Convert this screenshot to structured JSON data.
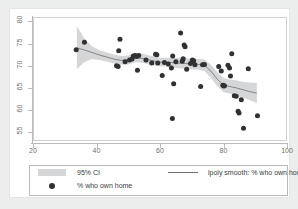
{
  "chart_data": {
    "type": "scatter",
    "title": "",
    "xlabel": "",
    "ylabel": "",
    "xlim": [
      20,
      100
    ],
    "ylim": [
      53,
      81
    ],
    "xticks": [
      20,
      40,
      60,
      80,
      100
    ],
    "yticks": [
      55,
      60,
      65,
      70,
      75,
      80
    ],
    "grid": false,
    "legend_position": "bottom",
    "series": [
      {
        "name": "% who own home",
        "type": "scatter",
        "marker": "filled-circle",
        "color": "#2f3133",
        "points": [
          [
            33.6,
            73.6
          ],
          [
            36.2,
            75.3
          ],
          [
            46.3,
            70.0
          ],
          [
            46.8,
            69.8
          ],
          [
            47.0,
            73.4
          ],
          [
            47.4,
            76.0
          ],
          [
            49.0,
            70.9
          ],
          [
            50.4,
            71.3
          ],
          [
            51.2,
            71.5
          ],
          [
            51.6,
            72.2
          ],
          [
            52.2,
            72.3
          ],
          [
            52.6,
            72.1
          ],
          [
            52.9,
            69.0
          ],
          [
            53.3,
            72.3
          ],
          [
            55.6,
            71.3
          ],
          [
            57.4,
            70.6
          ],
          [
            58.6,
            72.6
          ],
          [
            59.0,
            72.5
          ],
          [
            59.3,
            70.6
          ],
          [
            60.7,
            67.8
          ],
          [
            61.4,
            70.7
          ],
          [
            62.6,
            70.4
          ],
          [
            63.6,
            69.5
          ],
          [
            63.9,
            58.1
          ],
          [
            64.0,
            72.2
          ],
          [
            64.3,
            65.9
          ],
          [
            65.0,
            70.9
          ],
          [
            66.5,
            77.4
          ],
          [
            67.0,
            71.0
          ],
          [
            67.3,
            71.6
          ],
          [
            67.6,
            74.7
          ],
          [
            67.9,
            74.3
          ],
          [
            68.4,
            69.2
          ],
          [
            69.6,
            70.5
          ],
          [
            70.2,
            71.3
          ],
          [
            70.6,
            71.1
          ],
          [
            71.0,
            70.2
          ],
          [
            72.8,
            65.3
          ],
          [
            73.4,
            70.2
          ],
          [
            74.0,
            70.3
          ],
          [
            78.5,
            69.8
          ],
          [
            79.3,
            68.8
          ],
          [
            79.8,
            65.6
          ],
          [
            80.1,
            65.4
          ],
          [
            80.3,
            65.5
          ],
          [
            81.4,
            70.1
          ],
          [
            81.9,
            69.5
          ],
          [
            82.2,
            67.7
          ],
          [
            82.6,
            72.7
          ],
          [
            83.4,
            63.2
          ],
          [
            84.0,
            63.1
          ],
          [
            84.6,
            59.7
          ],
          [
            84.9,
            59.3
          ],
          [
            85.6,
            62.3
          ],
          [
            86.3,
            55.9
          ],
          [
            87.8,
            69.3
          ],
          [
            90.7,
            58.7
          ]
        ]
      },
      {
        "name": "lpoly smooth: % who own home",
        "type": "line",
        "color": "#6c6e70",
        "points": [
          [
            33.8,
            74.0
          ],
          [
            36.0,
            73.6
          ],
          [
            38.5,
            73.0
          ],
          [
            41.0,
            72.4
          ],
          [
            43.5,
            71.9
          ],
          [
            46.0,
            71.4
          ],
          [
            48.0,
            71.2
          ],
          [
            50.0,
            71.3
          ],
          [
            52.0,
            71.7
          ],
          [
            54.0,
            71.7
          ],
          [
            56.0,
            71.4
          ],
          [
            58.0,
            71.1
          ],
          [
            60.0,
            70.8
          ],
          [
            62.0,
            70.8
          ],
          [
            64.0,
            70.7
          ],
          [
            66.0,
            70.6
          ],
          [
            68.0,
            70.5
          ],
          [
            70.0,
            70.4
          ],
          [
            72.0,
            70.3
          ],
          [
            74.0,
            70.1
          ],
          [
            76.0,
            68.8
          ],
          [
            78.0,
            67.0
          ],
          [
            80.0,
            65.6
          ],
          [
            82.0,
            65.3
          ],
          [
            84.0,
            65.0
          ],
          [
            86.0,
            64.6
          ],
          [
            88.0,
            64.2
          ],
          [
            90.5,
            63.8
          ]
        ]
      },
      {
        "name": "95% CI",
        "type": "band",
        "color": "#d5d6d7",
        "upper": [
          [
            33.8,
            79.0
          ],
          [
            36.0,
            76.3
          ],
          [
            38.5,
            74.4
          ],
          [
            41.0,
            73.5
          ],
          [
            43.5,
            72.9
          ],
          [
            46.0,
            72.4
          ],
          [
            48.0,
            72.2
          ],
          [
            50.0,
            72.3
          ],
          [
            52.0,
            72.8
          ],
          [
            54.0,
            72.8
          ],
          [
            56.0,
            72.4
          ],
          [
            58.0,
            72.1
          ],
          [
            60.0,
            71.8
          ],
          [
            62.0,
            71.8
          ],
          [
            64.0,
            71.8
          ],
          [
            66.0,
            71.8
          ],
          [
            68.0,
            71.7
          ],
          [
            70.0,
            71.6
          ],
          [
            72.0,
            71.5
          ],
          [
            74.0,
            71.4
          ],
          [
            76.0,
            70.3
          ],
          [
            78.0,
            68.6
          ],
          [
            80.0,
            67.2
          ],
          [
            82.0,
            66.9
          ],
          [
            84.0,
            66.7
          ],
          [
            86.0,
            66.4
          ],
          [
            88.0,
            66.2
          ],
          [
            90.5,
            66.1
          ]
        ],
        "lower": [
          [
            33.8,
            69.2
          ],
          [
            36.0,
            70.7
          ],
          [
            38.5,
            71.5
          ],
          [
            41.0,
            71.3
          ],
          [
            43.5,
            70.9
          ],
          [
            46.0,
            70.4
          ],
          [
            48.0,
            70.2
          ],
          [
            50.0,
            70.3
          ],
          [
            52.0,
            70.7
          ],
          [
            54.0,
            70.7
          ],
          [
            56.0,
            70.4
          ],
          [
            58.0,
            70.1
          ],
          [
            60.0,
            69.8
          ],
          [
            62.0,
            69.8
          ],
          [
            64.0,
            69.6
          ],
          [
            66.0,
            69.4
          ],
          [
            68.0,
            69.3
          ],
          [
            70.0,
            69.2
          ],
          [
            72.0,
            69.1
          ],
          [
            74.0,
            68.8
          ],
          [
            76.0,
            67.3
          ],
          [
            78.0,
            65.4
          ],
          [
            80.0,
            64.0
          ],
          [
            82.0,
            63.7
          ],
          [
            84.0,
            63.3
          ],
          [
            86.0,
            62.8
          ],
          [
            88.0,
            62.3
          ],
          [
            90.5,
            61.5
          ]
        ]
      }
    ],
    "legend": [
      {
        "label": "95% CI",
        "key": "band-swatch"
      },
      {
        "label": "lpoly smooth: % who own home",
        "key": "line-swatch"
      },
      {
        "label": "% who own home",
        "key": "dot-swatch"
      }
    ]
  }
}
